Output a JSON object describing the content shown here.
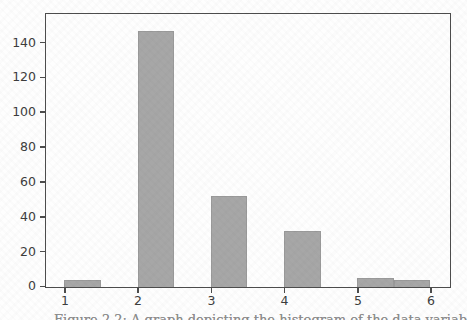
{
  "figure": {
    "caption_fragment": "Figure 2.2: A graph depicting the histogram of the data variable",
    "colors": {
      "bar_fill": "#a7a7a7",
      "bar_edge": "#9a9a9a",
      "spine": "#4d4d4d",
      "tick_label_color": "#3d3d3d",
      "background": "#fefefe",
      "caption_text": "#8d8d8d"
    }
  },
  "chart_data": {
    "type": "bar",
    "subtype": "histogram",
    "title": "",
    "xlabel": "",
    "ylabel": "",
    "grid": false,
    "legend": null,
    "x_ticks": [
      1,
      2,
      3,
      4,
      5,
      6
    ],
    "y_ticks": [
      0,
      20,
      40,
      60,
      80,
      100,
      120,
      140
    ],
    "xlim": [
      0.75,
      6.25
    ],
    "ylim": [
      0,
      156
    ],
    "bins": [
      {
        "x_start": 1.0,
        "x_end": 1.5,
        "count": 4
      },
      {
        "x_start": 2.0,
        "x_end": 2.5,
        "count": 147
      },
      {
        "x_start": 3.0,
        "x_end": 3.5,
        "count": 52
      },
      {
        "x_start": 4.0,
        "x_end": 4.5,
        "count": 32
      },
      {
        "x_start": 5.0,
        "x_end": 5.5,
        "count": 5
      },
      {
        "x_start": 5.5,
        "x_end": 6.0,
        "count": 4
      }
    ],
    "counts_by_value": {
      "1": 4,
      "2": 147,
      "3": 52,
      "4": 32,
      "5": 5,
      "6": 4
    }
  }
}
